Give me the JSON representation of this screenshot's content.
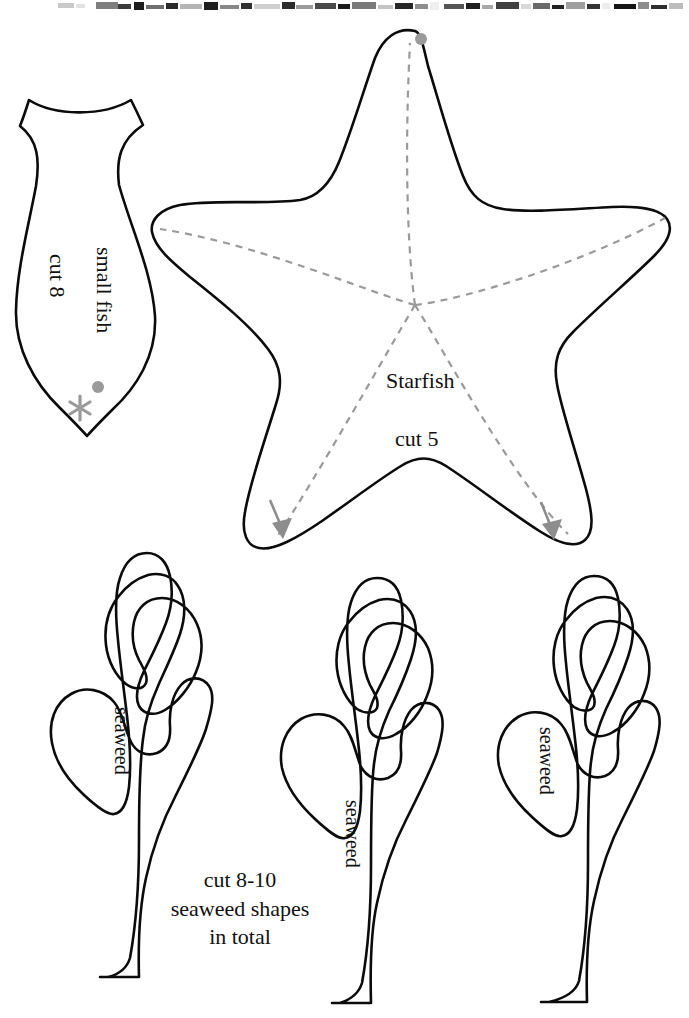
{
  "sheet": {
    "title": "Under the sea felt softie pattern sheet",
    "width": 689,
    "height": 1018,
    "background_color": "#ffffff",
    "ink_color": "#0b0b0b",
    "guide_color": "#9a9a9a"
  },
  "photo_strip": {
    "name": "scanned-photo-edge",
    "description": "clipped grayscale photograph fragment along the very top edge of the scan",
    "height_px": 12
  },
  "patterns": {
    "fish": {
      "name": "small fish",
      "label_line_1": "small fish",
      "label_line_2": "cut 8",
      "marks": {
        "dot": "gray-dot",
        "asterisk": "gray-asterisk"
      }
    },
    "starfish": {
      "name": "Starfish",
      "label_line_1": "Starfish",
      "label_line_2": "cut 5",
      "marks": {
        "dot": "gray-dot",
        "fold_lines": "dashed-arm-centre-lines",
        "arrows": 2
      }
    },
    "seaweed": {
      "name": "seaweed",
      "label": "seaweed",
      "count": 3,
      "note_line_1": "cut 8-10",
      "note_line_2": "seaweed shapes",
      "note_line_3": "in total"
    }
  },
  "labels": {
    "fish_name": "small fish",
    "fish_cut": "cut 8",
    "starfish_name": "Starfish",
    "starfish_cut": "cut 5",
    "seaweed_left": "seaweed",
    "seaweed_middle": "seaweed",
    "seaweed_right": "seaweed",
    "note_1": "cut 8-10",
    "note_2": "seaweed shapes",
    "note_3": "in total"
  }
}
